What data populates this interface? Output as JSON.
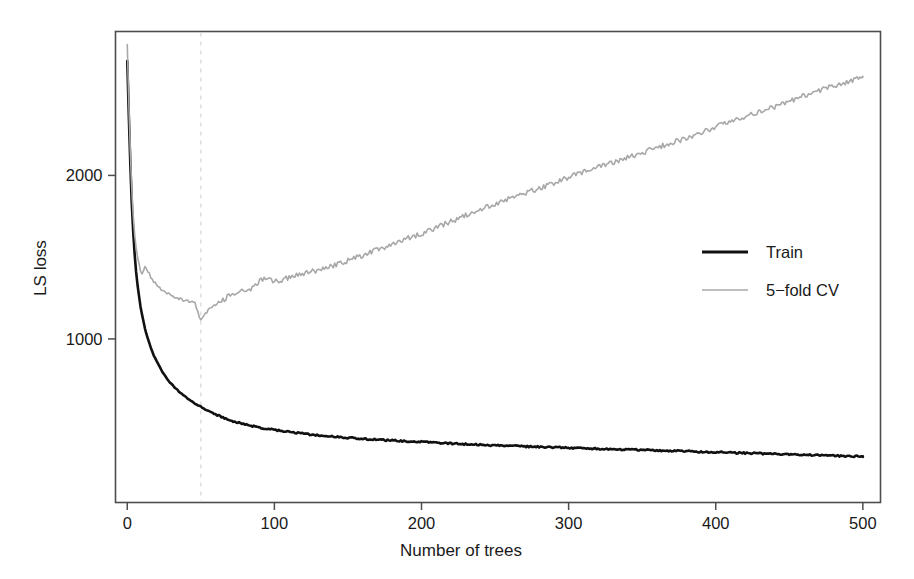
{
  "chart_data": {
    "type": "line",
    "title": "",
    "xlabel": "Number of trees",
    "ylabel": "LS loss",
    "xlim": [
      -8,
      512
    ],
    "ylim": [
      0,
      2880
    ],
    "xticks": [
      0,
      100,
      200,
      300,
      400,
      500
    ],
    "xtick_labels": [
      "0",
      "100",
      "200",
      "300",
      "400",
      "500"
    ],
    "yticks": [
      1000,
      2000
    ],
    "ytick_labels": [
      "1000",
      "2000"
    ],
    "grid": false,
    "legend_position": "right-middle",
    "annotations": [
      {
        "type": "vertical-dashed-line",
        "name": "optimal-trees-marker",
        "x": 50,
        "color": "#d8d8d8",
        "dash": "4,5"
      }
    ],
    "series": [
      {
        "name": "Train",
        "color": "#111111",
        "width": 2.6,
        "x": [
          0,
          1,
          2,
          3,
          4,
          5,
          6,
          7,
          8,
          9,
          10,
          12,
          14,
          16,
          18,
          20,
          23,
          26,
          29,
          32,
          35,
          38,
          42,
          46,
          50,
          55,
          60,
          65,
          70,
          75,
          80,
          85,
          90,
          95,
          100,
          110,
          120,
          130,
          140,
          150,
          160,
          170,
          180,
          190,
          200,
          215,
          230,
          245,
          260,
          275,
          290,
          305,
          320,
          335,
          350,
          365,
          380,
          395,
          410,
          425,
          440,
          455,
          470,
          485,
          500
        ],
        "values": [
          2700,
          2380,
          2090,
          1840,
          1660,
          1520,
          1410,
          1330,
          1260,
          1200,
          1150,
          1065,
          1000,
          945,
          900,
          862,
          812,
          770,
          735,
          706,
          680,
          657,
          630,
          606,
          585,
          560,
          538,
          519,
          503,
          490,
          478,
          468,
          459,
          451,
          444,
          431,
          420,
          411,
          403,
          396,
          390,
          384,
          379,
          374,
          370,
          363,
          357,
          351,
          346,
          341,
          337,
          333,
          329,
          325,
          321,
          317,
          313,
          309,
          305,
          301,
          297,
          293,
          289,
          285,
          282
        ]
      },
      {
        "name": "5-fold CV",
        "color": "#a8a8a8",
        "width": 1.6,
        "x": [
          0,
          1,
          2,
          3,
          4,
          5,
          6,
          7,
          8,
          9,
          10,
          12,
          14,
          16,
          18,
          20,
          23,
          26,
          29,
          32,
          35,
          38,
          42,
          46,
          50,
          55,
          60,
          65,
          70,
          75,
          80,
          85,
          90,
          95,
          100,
          110,
          120,
          130,
          140,
          150,
          160,
          170,
          180,
          190,
          200,
          215,
          230,
          245,
          260,
          275,
          290,
          305,
          320,
          335,
          350,
          365,
          380,
          395,
          410,
          425,
          440,
          455,
          470,
          485,
          500
        ],
        "values": [
          2800,
          2460,
          2170,
          1930,
          1760,
          1640,
          1560,
          1500,
          1455,
          1420,
          1395,
          1440,
          1415,
          1380,
          1350,
          1330,
          1300,
          1285,
          1270,
          1258,
          1248,
          1240,
          1230,
          1218,
          1110,
          1180,
          1215,
          1240,
          1268,
          1285,
          1300,
          1310,
          1355,
          1370,
          1350,
          1375,
          1400,
          1420,
          1450,
          1480,
          1510,
          1545,
          1580,
          1615,
          1645,
          1700,
          1755,
          1810,
          1860,
          1905,
          1955,
          2005,
          2050,
          2095,
          2140,
          2185,
          2230,
          2280,
          2330,
          2375,
          2420,
          2470,
          2520,
          2560,
          2600
        ]
      }
    ]
  },
  "legend": {
    "items": [
      {
        "label": "Train",
        "color": "#111111"
      },
      {
        "label": "5−fold CV",
        "color": "#a8a8a8"
      }
    ]
  },
  "axes": {
    "x_title": "Number of trees",
    "y_title": "LS loss"
  }
}
